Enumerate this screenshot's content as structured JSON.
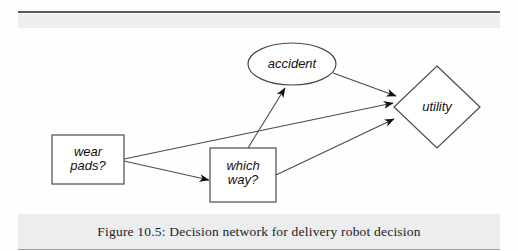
{
  "figure": {
    "caption": "Figure 10.5: Decision network for delivery robot decision",
    "type": "decision-network-diagram"
  },
  "nodes": [
    {
      "id": "wear-pads",
      "label": "wear\npads?",
      "line1": "wear",
      "line2": "pads?",
      "shape": "rectangle",
      "role": "decision",
      "x": 52,
      "y": 135,
      "width": 72,
      "height": 49
    },
    {
      "id": "which-way",
      "label": "which\nway?",
      "line1": "which",
      "line2": "way?",
      "shape": "rectangle",
      "role": "decision",
      "x": 210,
      "y": 148,
      "width": 66,
      "height": 54
    },
    {
      "id": "accident",
      "label": "accident",
      "shape": "ellipse",
      "role": "chance",
      "cx": 292,
      "cy": 64,
      "rx": 44,
      "ry": 21
    },
    {
      "id": "utility",
      "label": "utility",
      "shape": "diamond",
      "role": "value",
      "cx": 437,
      "cy": 107,
      "rx": 43,
      "ry": 41
    }
  ],
  "edges": [
    {
      "id": "edge-wear-pads-to-which-way",
      "from": "wear-pads",
      "to": "which-way"
    },
    {
      "id": "edge-wear-pads-to-utility",
      "from": "wear-pads",
      "to": "utility"
    },
    {
      "id": "edge-which-way-to-accident",
      "from": "which-way",
      "to": "accident"
    },
    {
      "id": "edge-which-way-to-utility",
      "from": "which-way",
      "to": "utility"
    },
    {
      "id": "edge-accident-to-utility",
      "from": "accident",
      "to": "utility"
    }
  ],
  "colors": {
    "background": "#fefefe",
    "stroke": "#4a4a4a",
    "arrow_fill": "#111111",
    "text": "#111111",
    "band": "#ebedee",
    "rule": "#585c60"
  }
}
